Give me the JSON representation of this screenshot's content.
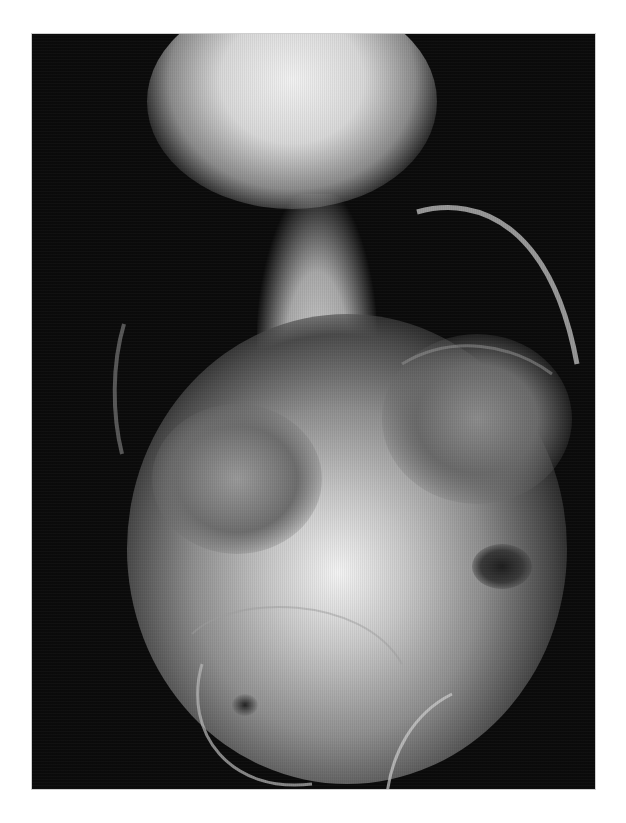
{
  "image": {
    "description": "Frontal radiograph (X-ray) of the torso and abdomen",
    "modality": "X-ray",
    "background_color": "#ffffff",
    "frame_color": "#0b0b0b",
    "tone": "grayscale"
  }
}
